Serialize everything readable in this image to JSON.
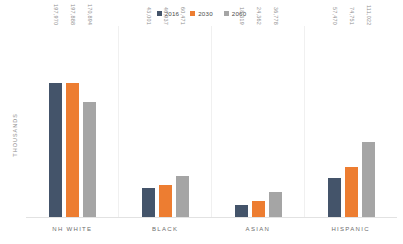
{
  "chart_data": {
    "type": "bar",
    "title": "",
    "subtitle": "",
    "xlabel": "",
    "ylabel": "THOUSANDS",
    "categories": [
      "NH WHITE",
      "BLACK",
      "ASIAN",
      "HISPANIC"
    ],
    "series": [
      {
        "name": "2016",
        "color": "#44546A",
        "values": [
          197970,
          43001,
          18319,
          57470
        ],
        "labels": [
          "197,970",
          "43,001",
          "18,319",
          "57,470"
        ]
      },
      {
        "name": "2030",
        "color": "#ED7D31",
        "values": [
          197888,
          46937,
          24362,
          74751
        ],
        "labels": [
          "197,888",
          "46,937",
          "24,362",
          "74,751"
        ]
      },
      {
        "name": "2060",
        "color": "#A5A5A5",
        "values": [
          170894,
          60471,
          36778,
          111022
        ],
        "labels": [
          "170,894",
          "60,471",
          "36,778",
          "111,022"
        ]
      }
    ],
    "ylim": [
      0,
      197970
    ],
    "grid": false,
    "legend_position": "top-center",
    "value_labels": true,
    "value_label_orientation": "vertical"
  }
}
